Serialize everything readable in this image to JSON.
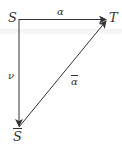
{
  "diagram": {
    "nodes": {
      "S": "S",
      "T": "T",
      "S_bar": "S"
    },
    "edges": {
      "alpha": "α",
      "nu": "ν",
      "alpha_bar": "α"
    },
    "arrows": [
      {
        "from": "S",
        "to": "T",
        "label": "α"
      },
      {
        "from": "S",
        "to": "S̄",
        "label": "ν"
      },
      {
        "from": "S̄",
        "to": "T",
        "label": "ᾱ"
      }
    ],
    "stroke_color": "#333333"
  }
}
